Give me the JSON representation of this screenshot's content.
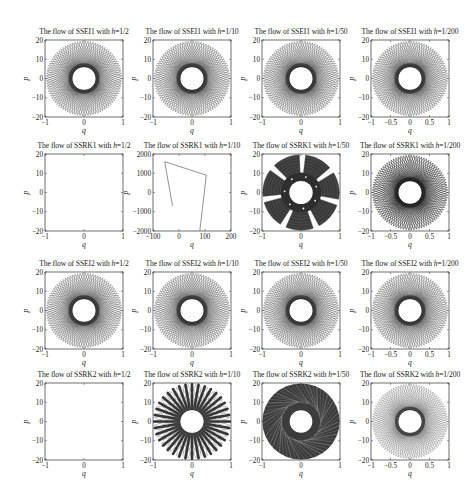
{
  "figure": {
    "rows": 4,
    "cols": 4,
    "title_prefix": "The flow of",
    "title_mid": "with",
    "h_symbol": "h",
    "eq": "="
  },
  "chart_data": [
    {
      "type": "line",
      "method": "SSEI1",
      "h": "1/2",
      "title": "The flow of SSEI1 with h=1/2",
      "xlabel": "q",
      "ylabel": "p",
      "xlim": [
        -1,
        1
      ],
      "ylim": [
        -20,
        20
      ],
      "xticks": [
        "-1",
        "0",
        "1"
      ],
      "yticks": [
        "20",
        "10",
        "0",
        "-10",
        "-20"
      ],
      "pattern": "rosette",
      "inner_radius": 6,
      "outer_radius": 20,
      "petals": 90,
      "density": "medium",
      "grid": false
    },
    {
      "type": "line",
      "method": "SSEI1",
      "h": "1/10",
      "title": "The flow of SSEI1 with h=1/10",
      "xlabel": "q",
      "ylabel": "p",
      "xlim": [
        -1,
        1
      ],
      "ylim": [
        -20,
        20
      ],
      "xticks": [
        "-1",
        "0",
        "1"
      ],
      "yticks": [
        "20",
        "10",
        "0",
        "-10",
        "-20"
      ],
      "pattern": "rosette",
      "inner_radius": 6,
      "outer_radius": 20,
      "petals": 90,
      "density": "medium",
      "grid": false
    },
    {
      "type": "line",
      "method": "SSEI1",
      "h": "1/50",
      "title": "The flow of SSEI1 with h=1/50",
      "xlabel": "q",
      "ylabel": "p",
      "xlim": [
        -1,
        1
      ],
      "ylim": [
        -20,
        20
      ],
      "xticks": [
        "-1",
        "0",
        "1"
      ],
      "yticks": [
        "20",
        "10",
        "0",
        "-10",
        "-20"
      ],
      "pattern": "rosette",
      "inner_radius": 6,
      "outer_radius": 20,
      "petals": 90,
      "density": "medium",
      "grid": false
    },
    {
      "type": "line",
      "method": "SSEI1",
      "h": "1/200",
      "title": "The flow of SSEI1 with h=1/200",
      "xlabel": "q",
      "ylabel": "p",
      "xlim": [
        -1,
        1
      ],
      "ylim": [
        -20,
        20
      ],
      "xticks": [
        "-1",
        "-0.5",
        "0",
        "0.5",
        "1"
      ],
      "yticks": [
        "20",
        "10",
        "0",
        "-10",
        "-20"
      ],
      "pattern": "rosette",
      "inner_radius": 6,
      "outer_radius": 20,
      "petals": 90,
      "density": "medium",
      "grid": false
    },
    {
      "type": "line",
      "method": "SSRK1",
      "h": "1/2",
      "title": "The flow of SSRK1 with h=1/2",
      "xlabel": "q",
      "ylabel": "p",
      "xlim": [
        -1,
        1
      ],
      "ylim": [
        -20,
        20
      ],
      "xticks": [
        "-1",
        "0",
        "1"
      ],
      "yticks": [
        "20",
        "10",
        "0",
        "-10",
        "-20"
      ],
      "pattern": "empty",
      "grid": false
    },
    {
      "type": "line",
      "method": "SSRK1",
      "h": "1/10",
      "title": "The flow of SSRK1 with h=1/10",
      "xlabel": "q",
      "ylabel": "p",
      "xlim": [
        -100,
        200
      ],
      "ylim": [
        -2000,
        2000
      ],
      "xticks": [
        "-100",
        "0",
        "100",
        "200"
      ],
      "yticks": [
        "2000",
        "1000",
        "0",
        "-1000",
        "-2000"
      ],
      "pattern": "polyline",
      "points": [
        [
          -25,
          -700
        ],
        [
          -55,
          1600
        ],
        [
          105,
          900
        ],
        [
          80,
          -2000
        ]
      ],
      "grid": false
    },
    {
      "type": "line",
      "method": "SSRK1",
      "h": "1/50",
      "title": "The flow of SSRK1 with h=1/50",
      "xlabel": "q",
      "ylabel": "p",
      "xlim": [
        -1,
        1
      ],
      "ylim": [
        -20,
        20
      ],
      "xticks": [
        "-1",
        "0",
        "1"
      ],
      "yticks": [
        "20",
        "10",
        "0",
        "-10",
        "-20"
      ],
      "pattern": "petal7",
      "inner_radius": 6,
      "outer_radius": 20,
      "petals": 7,
      "grid": false
    },
    {
      "type": "line",
      "method": "SSRK1",
      "h": "1/200",
      "title": "The flow of SSRK1 with h=1/200",
      "xlabel": "q",
      "ylabel": "p",
      "xlim": [
        -1,
        1
      ],
      "ylim": [
        -20,
        20
      ],
      "xticks": [
        "-1",
        "-0.5",
        "0",
        "0.5",
        "1"
      ],
      "yticks": [
        "20",
        "10",
        "0",
        "-10",
        "-20"
      ],
      "pattern": "rosette",
      "inner_radius": 6,
      "outer_radius": 20,
      "petals": 90,
      "density": "heavy",
      "grid": false
    },
    {
      "type": "line",
      "method": "SSEI2",
      "h": "1/2",
      "title": "The flow of SSEI2 with h=1/2",
      "xlabel": "q",
      "ylabel": "p",
      "xlim": [
        -1,
        1
      ],
      "ylim": [
        -20,
        20
      ],
      "xticks": [
        "-1",
        "0",
        "1"
      ],
      "yticks": [
        "20",
        "10",
        "0",
        "-10",
        "-20"
      ],
      "pattern": "rosette",
      "inner_radius": 6,
      "outer_radius": 20,
      "petals": 90,
      "density": "medium",
      "grid": false
    },
    {
      "type": "line",
      "method": "SSEI2",
      "h": "1/10",
      "title": "The flow of SSEI2 with h=1/10",
      "xlabel": "q",
      "ylabel": "p",
      "xlim": [
        -1,
        1
      ],
      "ylim": [
        -20,
        20
      ],
      "xticks": [
        "-1",
        "0",
        "1"
      ],
      "yticks": [
        "20",
        "10",
        "0",
        "-10",
        "-20"
      ],
      "pattern": "rosette",
      "inner_radius": 6,
      "outer_radius": 20,
      "petals": 90,
      "density": "medium",
      "grid": false
    },
    {
      "type": "line",
      "method": "SSEI2",
      "h": "1/50",
      "title": "The flow of SSEI2 with h=1/50",
      "xlabel": "q",
      "ylabel": "p",
      "xlim": [
        -1,
        1
      ],
      "ylim": [
        -20,
        20
      ],
      "xticks": [
        "-1",
        "0",
        "1"
      ],
      "yticks": [
        "20",
        "10",
        "0",
        "-10",
        "-20"
      ],
      "pattern": "rosette",
      "inner_radius": 6,
      "outer_radius": 20,
      "petals": 90,
      "density": "medium",
      "grid": false
    },
    {
      "type": "line",
      "method": "SSEI2",
      "h": "1/200",
      "title": "The flow of SSEI2 with h=1/200",
      "xlabel": "q",
      "ylabel": "p",
      "xlim": [
        -1,
        1
      ],
      "ylim": [
        -20,
        20
      ],
      "xticks": [
        "-1",
        "-0.5",
        "0",
        "0.5",
        "1"
      ],
      "yticks": [
        "20",
        "10",
        "0",
        "-10",
        "-20"
      ],
      "pattern": "rosette",
      "inner_radius": 6,
      "outer_radius": 20,
      "petals": 90,
      "density": "medium",
      "grid": false
    },
    {
      "type": "line",
      "method": "SSRK2",
      "h": "1/2",
      "title": "The flow of SSRK2 with h=1/2",
      "xlabel": "q",
      "ylabel": "p",
      "xlim": [
        -1,
        1
      ],
      "ylim": [
        -20,
        20
      ],
      "xticks": [
        "-1",
        "0",
        "1"
      ],
      "yticks": [
        "20",
        "10",
        "0",
        "-10",
        "-20"
      ],
      "pattern": "empty",
      "grid": false
    },
    {
      "type": "line",
      "method": "SSRK2",
      "h": "1/10",
      "title": "The flow of SSRK2 with h=1/10",
      "xlabel": "q",
      "ylabel": "p",
      "xlim": [
        -1,
        1
      ],
      "ylim": [
        -20,
        20
      ],
      "xticks": [
        "-1",
        "0",
        "1"
      ],
      "yticks": [
        "20",
        "10",
        "0",
        "-10",
        "-20"
      ],
      "pattern": "lobes",
      "inner_radius": 6,
      "outer_radius": 20,
      "petals": 36,
      "grid": false
    },
    {
      "type": "line",
      "method": "SSRK2",
      "h": "1/50",
      "title": "The flow of SSRK2 with h=1/50",
      "xlabel": "q",
      "ylabel": "p",
      "xlim": [
        -1,
        1
      ],
      "ylim": [
        -20,
        20
      ],
      "xticks": [
        "-1",
        "0",
        "1"
      ],
      "yticks": [
        "20",
        "10",
        "0",
        "-10",
        "-20"
      ],
      "pattern": "chaotic",
      "inner_radius": 6,
      "outer_radius": 20,
      "grid": false
    },
    {
      "type": "line",
      "method": "SSRK2",
      "h": "1/200",
      "title": "The flow of SSRK2 with h=1/200",
      "xlabel": "q",
      "ylabel": "p",
      "xlim": [
        -1,
        1
      ],
      "ylim": [
        -20,
        20
      ],
      "xticks": [
        "-1",
        "-0.5",
        "0",
        "0.5",
        "1"
      ],
      "yticks": [
        "20",
        "10",
        "0",
        "-10",
        "-20"
      ],
      "pattern": "rosette",
      "inner_radius": 6,
      "outer_radius": 20,
      "petals": 90,
      "density": "light",
      "grid": false
    }
  ]
}
